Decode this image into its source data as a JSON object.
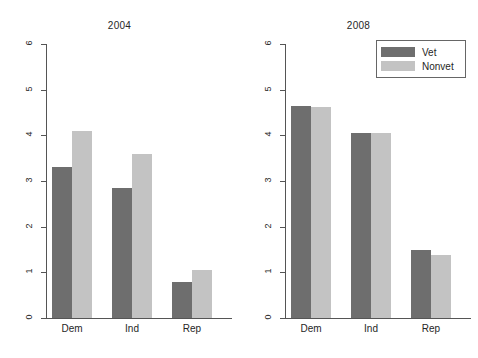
{
  "chart_data": {
    "type": "bar",
    "title": "",
    "xlabel": "",
    "ylabel": "",
    "ylim": [
      0,
      6
    ],
    "yticks": [
      0,
      1,
      2,
      3,
      4,
      5,
      6
    ],
    "ytick_labels": [
      "0",
      "1",
      "2",
      "3",
      "4",
      "5",
      "6"
    ],
    "grid": false,
    "legend_position": "top-right of right panel",
    "categories": [
      "Dem",
      "Ind",
      "Rep"
    ],
    "series": [
      {
        "name": "Vet",
        "color": "#6e6e6e"
      },
      {
        "name": "Nonvet",
        "color": "#c3c3c3"
      }
    ],
    "panels": [
      {
        "title": "2004",
        "categories": [
          "Dem",
          "Ind",
          "Rep"
        ],
        "series": [
          {
            "name": "Vet",
            "values": [
              3.3,
              2.85,
              0.78
            ]
          },
          {
            "name": "Nonvet",
            "values": [
              4.1,
              3.6,
              1.05
            ]
          }
        ]
      },
      {
        "title": "2008",
        "categories": [
          "Dem",
          "Ind",
          "Rep"
        ],
        "series": [
          {
            "name": "Vet",
            "values": [
              4.65,
              4.05,
              1.5
            ]
          },
          {
            "name": "Nonvet",
            "values": [
              4.63,
              4.05,
              1.38
            ]
          }
        ]
      }
    ]
  },
  "legend": {
    "items": [
      {
        "label": "Vet",
        "color": "#6e6e6e"
      },
      {
        "label": "Nonvet",
        "color": "#c3c3c3"
      }
    ]
  },
  "colors": {
    "vet": "#6e6e6e",
    "nonvet": "#c3c3c3",
    "axis": "#555555",
    "text": "#262626",
    "background": "#ffffff"
  }
}
